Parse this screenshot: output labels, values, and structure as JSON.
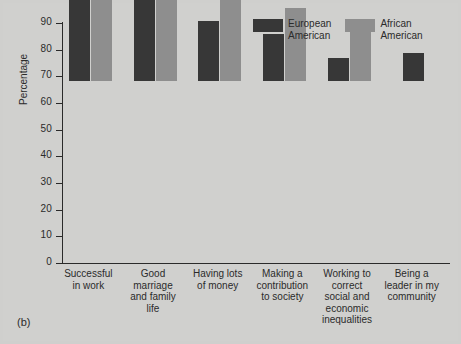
{
  "figure": {
    "panel_label": "(b)",
    "background_color": "#d0d0ce"
  },
  "chart_data": {
    "type": "bar",
    "title": "",
    "xlabel": "",
    "ylabel": "Percentage",
    "ylim": [
      0,
      90
    ],
    "yticks": [
      0,
      10,
      20,
      30,
      40,
      50,
      60,
      70,
      80,
      90
    ],
    "ytick_labels": [
      "0",
      "10",
      "20",
      "30",
      "40",
      "50",
      "60",
      "70",
      "80",
      "90"
    ],
    "grid": false,
    "legend_position": "top-right",
    "categories": [
      "Successful\nin work",
      "Good\nmarriage\nand family\nlife",
      "Having lots\nof money",
      "Making a\ncontribution\nto society",
      "Working to\ncorrect\nsocial and\neconomic\ninequalities",
      "Being a\nleader in my\ncommunity"
    ],
    "series": [
      {
        "name": "European\nAmerican",
        "color": "#373737",
        "values": [
          60,
          78,
          22.5,
          17.5,
          8.5,
          10.5
        ]
      },
      {
        "name": "African\nAmerican",
        "color": "#8e8e8e",
        "values": [
          70,
          75,
          47,
          27.5,
          18.5,
          null
        ]
      }
    ]
  }
}
